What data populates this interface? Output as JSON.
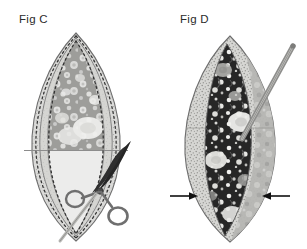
{
  "document": {
    "kind": "surgical-technique-illustration",
    "background_color": "#ffffff",
    "panel_count": 2
  },
  "panels": [
    {
      "id": "fig-c",
      "label": "Fig C",
      "caption_position": "top-left",
      "specimen": {
        "shape": "pointed-oval",
        "description": "bivalved specimen with layered dissection planes",
        "outer_fill": "#d8d8d6",
        "mid_fill": "#c9c9c6",
        "inner_fill": "#ececeb",
        "lesion_fill": "#9a9a98",
        "outline_color": "#6e6e6e"
      },
      "markings": {
        "dotted_plane_count": 4,
        "dotted_color": "#333333",
        "horizontal_reference_line": true,
        "horizontal_line_color": "#8c8c8c"
      },
      "instrument": {
        "name": "surgical-scissors",
        "blade_color": "#2c2c2c",
        "handle_color": "#6f6f6f",
        "ring_count": 2,
        "orientation": "angled-from-lower-right"
      }
    },
    {
      "id": "fig-d",
      "label": "Fig D",
      "caption_position": "top-left",
      "specimen": {
        "shape": "pointed-oval",
        "description": "opened specimen exposing dark nodular tissue",
        "outer_fill": "#d2d2cf",
        "stipple_fill": "#bfbfbc",
        "cavity_fill": "#2a2a2a",
        "nodule_highlight": "#f2f2ef",
        "outline_color": "#6e6e6e"
      },
      "markings": {
        "arrow_count": 2,
        "arrow_color": "#111111",
        "arrow_direction": "inward",
        "arrow_side_labels": [
          "left-margin",
          "right-margin"
        ]
      },
      "instrument": {
        "name": "probe-rod",
        "body_color": "#8e8e8c",
        "orientation": "angled-from-upper-right"
      }
    }
  ]
}
